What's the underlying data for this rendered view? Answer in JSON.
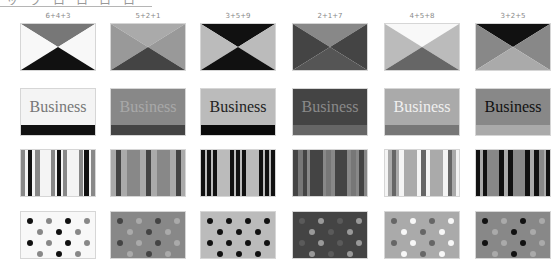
{
  "header": {
    "title_fragment": "ッ ヲ ロ ロ ロ ロ"
  },
  "palette_scale": {
    "1": "#f4f4f4",
    "2": "#aaaaaa",
    "3": "#777777",
    "4": "#bbbbbb",
    "5": "#888888",
    "6": "#f8f8f8",
    "7": "#444444",
    "8": "#666666",
    "9": "#111111"
  },
  "columns": [
    {
      "label": "6+4+3",
      "x": 20,
      "xpattern": {
        "top": "#777777",
        "sides": "#f8f8f8",
        "bottom": "#111111"
      },
      "business": {
        "bg": "#f4f4f4",
        "text": "#777777",
        "bar": "#111111",
        "word": "Business"
      },
      "stripes": [
        [
          "#888888",
          4
        ],
        [
          "#f4f4f4",
          3
        ],
        [
          "#111111",
          5
        ],
        [
          "#f4f4f4",
          3
        ],
        [
          "#888888",
          5
        ],
        [
          "#f4f4f4",
          12
        ],
        [
          "#888888",
          4
        ],
        [
          "#f4f4f4",
          2
        ],
        [
          "#111111",
          4
        ],
        [
          "#f4f4f4",
          2
        ],
        [
          "#888888",
          5
        ],
        [
          "#f4f4f4",
          12
        ],
        [
          "#888888",
          4
        ],
        [
          "#f4f4f4",
          2
        ],
        [
          "#111111",
          5
        ],
        [
          "#f4f4f4",
          2
        ],
        [
          "#888888",
          4
        ]
      ],
      "dots": {
        "bg": "#f8f8f8",
        "c1": "#111111",
        "c2": "#888888"
      }
    },
    {
      "label": "5+2+1",
      "x": 110,
      "xpattern": {
        "top": "#aaaaaa",
        "sides": "#999999",
        "bottom": "#444444"
      },
      "business": {
        "bg": "#888888",
        "text": "#a8a8a8",
        "bar": "#444444",
        "word": "Business"
      },
      "stripes": [
        [
          "#aaaaaa",
          5
        ],
        [
          "#444444",
          5
        ],
        [
          "#aaaaaa",
          6
        ],
        [
          "#888888",
          12
        ],
        [
          "#aaaaaa",
          6
        ],
        [
          "#444444",
          5
        ],
        [
          "#aaaaaa",
          6
        ],
        [
          "#888888",
          12
        ],
        [
          "#aaaaaa",
          6
        ],
        [
          "#444444",
          5
        ],
        [
          "#aaaaaa",
          4
        ]
      ],
      "dots": {
        "bg": "#888888",
        "c1": "#444444",
        "c2": "#aaaaaa"
      }
    },
    {
      "label": "3+5+9",
      "x": 200,
      "xpattern": {
        "top": "#111111",
        "sides": "#bbbbbb",
        "bottom": "#111111"
      },
      "business": {
        "bg": "#bbbbbb",
        "text": "#222222",
        "bar": "#0a0a0a",
        "word": "Business"
      },
      "stripes": [
        [
          "#111111",
          4
        ],
        [
          "#bbbbbb",
          2
        ],
        [
          "#111111",
          4
        ],
        [
          "#bbbbbb",
          2
        ],
        [
          "#111111",
          4
        ],
        [
          "#bbbbbb",
          14
        ],
        [
          "#111111",
          4
        ],
        [
          "#bbbbbb",
          2
        ],
        [
          "#111111",
          4
        ],
        [
          "#bbbbbb",
          2
        ],
        [
          "#111111",
          4
        ],
        [
          "#bbbbbb",
          14
        ],
        [
          "#111111",
          4
        ],
        [
          "#bbbbbb",
          2
        ],
        [
          "#111111",
          4
        ],
        [
          "#bbbbbb",
          2
        ],
        [
          "#111111",
          4
        ]
      ],
      "dots": {
        "bg": "#bbbbbb",
        "c1": "#111111",
        "c2": "#111111"
      }
    },
    {
      "label": "2+1+7",
      "x": 292,
      "xpattern": {
        "top": "#888888",
        "sides": "#444444",
        "bottom": "#555555"
      },
      "business": {
        "bg": "#444444",
        "text": "#8a8a8a",
        "bar": "#666666",
        "word": "Business"
      },
      "stripes": [
        [
          "#444444",
          4
        ],
        [
          "#777777",
          4
        ],
        [
          "#444444",
          3
        ],
        [
          "#888888",
          3
        ],
        [
          "#444444",
          10
        ],
        [
          "#888888",
          3
        ],
        [
          "#777777",
          4
        ],
        [
          "#888888",
          3
        ],
        [
          "#444444",
          10
        ],
        [
          "#888888",
          3
        ],
        [
          "#777777",
          4
        ],
        [
          "#888888",
          3
        ],
        [
          "#444444",
          4
        ],
        [
          "#888888",
          2
        ]
      ],
      "dots": {
        "bg": "#444444",
        "c1": "#5a5a5a",
        "c2": "#999999"
      }
    },
    {
      "label": "4+5+8",
      "x": 384,
      "xpattern": {
        "top": "#f8f8f8",
        "sides": "#bbbbbb",
        "bottom": "#666666"
      },
      "business": {
        "bg": "#aaaaaa",
        "text": "#f0f0f0",
        "bar": "#777777",
        "word": "Business"
      },
      "stripes": [
        [
          "#f4f4f4",
          3
        ],
        [
          "#aaaaaa",
          3
        ],
        [
          "#666666",
          4
        ],
        [
          "#aaaaaa",
          3
        ],
        [
          "#f4f4f4",
          4
        ],
        [
          "#aaaaaa",
          12
        ],
        [
          "#f4f4f4",
          4
        ],
        [
          "#666666",
          4
        ],
        [
          "#f4f4f4",
          4
        ],
        [
          "#aaaaaa",
          12
        ],
        [
          "#f4f4f4",
          4
        ],
        [
          "#666666",
          4
        ],
        [
          "#aaaaaa",
          3
        ],
        [
          "#f4f4f4",
          3
        ]
      ],
      "dots": {
        "bg": "#aaaaaa",
        "c1": "#666666",
        "c2": "#f8f8f8"
      }
    },
    {
      "label": "3+2+5",
      "x": 475,
      "xpattern": {
        "top": "#111111",
        "sides": "#888888",
        "bottom": "#aaaaaa"
      },
      "business": {
        "bg": "#888888",
        "text": "#111111",
        "bar": "#aaaaaa",
        "word": "Business"
      },
      "stripes": [
        [
          "#111111",
          3
        ],
        [
          "#aaaaaa",
          3
        ],
        [
          "#111111",
          3
        ],
        [
          "#888888",
          10
        ],
        [
          "#111111",
          4
        ],
        [
          "#aaaaaa",
          3
        ],
        [
          "#111111",
          4
        ],
        [
          "#888888",
          10
        ],
        [
          "#111111",
          4
        ],
        [
          "#aaaaaa",
          3
        ],
        [
          "#111111",
          4
        ],
        [
          "#888888",
          4
        ],
        [
          "#aaaaaa",
          2
        ],
        [
          "#111111",
          3
        ]
      ],
      "dots": {
        "bg": "#888888",
        "c1": "#111111",
        "c2": "#aaaaaa"
      }
    }
  ],
  "rows": {
    "xpattern_top": 23,
    "business_top": 88,
    "stripes_top": 149,
    "dots_top": 211
  }
}
